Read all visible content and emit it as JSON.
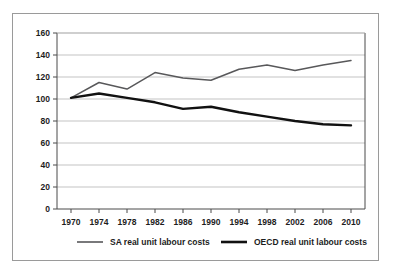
{
  "caption_strip": {
    "text": ""
  },
  "chart_data": {
    "type": "line",
    "title": "",
    "subtitle": "",
    "xlabel": "",
    "ylabel": "",
    "x": [
      1970,
      1974,
      1978,
      1982,
      1986,
      1990,
      1994,
      1998,
      2002,
      2006,
      2010
    ],
    "xtick_labels": [
      "1970",
      "1974",
      "1978",
      "1982",
      "1986",
      "1990",
      "1994",
      "1998",
      "2002",
      "2006",
      "2010"
    ],
    "xlim": [
      1968,
      2012
    ],
    "ytick_labels": [
      "0",
      "20",
      "40",
      "60",
      "80",
      "100",
      "120",
      "140",
      "160"
    ],
    "yticks": [
      0,
      20,
      40,
      60,
      80,
      100,
      120,
      140,
      160
    ],
    "ylim": [
      0,
      160
    ],
    "grid": "horizontal",
    "legend_position": "bottom",
    "series": [
      {
        "name": "SA real unit labour costs",
        "color": "#58585a",
        "linewidth": 1.5,
        "values": [
          101,
          115,
          109,
          124,
          119,
          117,
          127,
          131,
          126,
          131,
          135
        ]
      },
      {
        "name": "OECD real unit labour costs",
        "color": "#111111",
        "linewidth": 2.4,
        "values": [
          101,
          105,
          101,
          97,
          91,
          93,
          88,
          84,
          80,
          77,
          76
        ]
      }
    ]
  }
}
